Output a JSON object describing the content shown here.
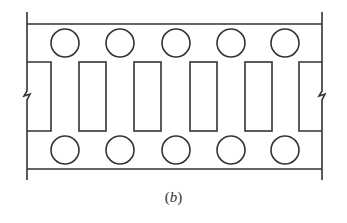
{
  "caption": {
    "open": "(",
    "letter": "b",
    "close": ")"
  },
  "colors": {
    "stroke": "#333333",
    "background": "#ffffff"
  },
  "diagram": {
    "top_rail_y": 24,
    "bottom_rail_y": 169,
    "left_edge_x": 27,
    "right_edge_x": 322,
    "circles_top": [
      {
        "cx": 65,
        "cy": 43,
        "r": 14
      },
      {
        "cx": 120,
        "cy": 43,
        "r": 14
      },
      {
        "cx": 176,
        "cy": 43,
        "r": 14
      },
      {
        "cx": 231,
        "cy": 43,
        "r": 14
      },
      {
        "cx": 285,
        "cy": 43,
        "r": 14
      }
    ],
    "circles_bottom": [
      {
        "cx": 65,
        "cy": 150,
        "r": 14
      },
      {
        "cx": 120,
        "cy": 150,
        "r": 14
      },
      {
        "cx": 176,
        "cy": 150,
        "r": 14
      },
      {
        "cx": 231,
        "cy": 150,
        "r": 14
      },
      {
        "cx": 285,
        "cy": 150,
        "r": 14
      }
    ],
    "rects": [
      {
        "x": 79,
        "y": 62,
        "w": 27,
        "h": 69
      },
      {
        "x": 134,
        "y": 62,
        "w": 27,
        "h": 69
      },
      {
        "x": 190,
        "y": 62,
        "w": 27,
        "h": 69
      },
      {
        "x": 245,
        "y": 62,
        "w": 27,
        "h": 69
      }
    ],
    "partial_rects": [
      "left",
      "right"
    ],
    "break_marks": [
      "left",
      "right"
    ]
  }
}
